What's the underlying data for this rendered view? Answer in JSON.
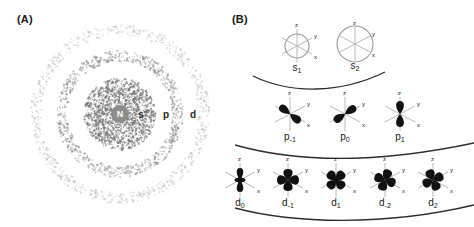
{
  "figure": {
    "panels": [
      {
        "id": "A",
        "label": "(A)"
      },
      {
        "id": "B",
        "label": "(B)"
      }
    ]
  },
  "panel_a": {
    "name": "atom-shell-stipple-diagram",
    "nucleus_label": "N",
    "nucleus": {
      "cx": 120,
      "cy": 114,
      "r": 9,
      "color": "#8d8d8d",
      "text_color": "#ffffff"
    },
    "shells": [
      {
        "name": "s-shell",
        "label": "s",
        "radius": 36,
        "density": 0.95,
        "dot_color": "#6f6f6f"
      },
      {
        "name": "p-shell",
        "label": "p",
        "radius": 58,
        "density": 0.75,
        "dot_color": "#8a8a8a"
      },
      {
        "name": "d-shell",
        "label": "d",
        "radius": 84,
        "density": 0.45,
        "dot_color": "#b0b0b0"
      }
    ],
    "shell_labels": [
      {
        "text": "s",
        "x": 141,
        "y": 114
      },
      {
        "text": "p",
        "x": 166,
        "y": 114
      },
      {
        "text": "d",
        "x": 193,
        "y": 114
      }
    ]
  },
  "panel_b": {
    "name": "orbital-shape-chart",
    "axis_labels": {
      "z": "z",
      "y": "y",
      "x": "x"
    },
    "rows": [
      {
        "name": "s-orbital-row",
        "type": "s",
        "orbitals": [
          {
            "label_main": "s",
            "label_sub": "1",
            "shape": "sphere",
            "radius": 12,
            "cx": 62,
            "cy": 46
          },
          {
            "label_main": "s",
            "label_sub": "2",
            "shape": "sphere",
            "radius": 18,
            "cx": 120,
            "cy": 44
          }
        ],
        "divider": "M 18 76 C 55 94, 105 94, 150 72"
      },
      {
        "name": "p-orbital-row",
        "type": "p",
        "orbitals": [
          {
            "label_main": "p",
            "label_sub": "-1",
            "shape": "dumbbell",
            "angle": 128,
            "cx": 55,
            "cy": 114
          },
          {
            "label_main": "p",
            "label_sub": "0",
            "shape": "dumbbell",
            "angle": 56,
            "cx": 110,
            "cy": 114
          },
          {
            "label_main": "p",
            "label_sub": "1",
            "shape": "dumbbell",
            "angle": 0,
            "cx": 165,
            "cy": 114
          }
        ],
        "divider": "M 0 145 C 60 162, 140 164, 239 143"
      },
      {
        "name": "d-orbital-row",
        "type": "d",
        "orbitals": [
          {
            "label_main": "d",
            "label_sub": "0",
            "shape": "dz2",
            "angle": 0,
            "cx": 5,
            "cy": 180
          },
          {
            "label_main": "d",
            "label_sub": "-1",
            "shape": "clover",
            "angle": 0,
            "cx": 53,
            "cy": 180
          },
          {
            "label_main": "d",
            "label_sub": "1",
            "shape": "clover",
            "angle": 45,
            "cx": 101,
            "cy": 180
          },
          {
            "label_main": "d",
            "label_sub": "-2",
            "shape": "clover",
            "angle": 20,
            "cx": 150,
            "cy": 180
          },
          {
            "label_main": "d",
            "label_sub": "2",
            "shape": "clover",
            "angle": 65,
            "cx": 198,
            "cy": 180
          }
        ],
        "divider": "M 0 208 C 60 224, 150 226, 239 205"
      }
    ]
  },
  "colors": {
    "orbital_fill": "#111111",
    "axis_line": "#b9b9b9",
    "divider_line": "#2b2b2b",
    "background": "#ffffff"
  }
}
